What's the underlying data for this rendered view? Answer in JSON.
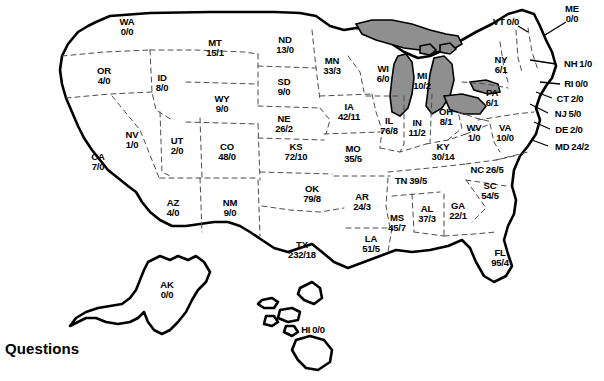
{
  "page": {
    "heading": "Questions",
    "colors": {
      "lake_fill": "#8f8f8f",
      "outline": "#000000",
      "state_border": "#4d4d4d",
      "background": "#ffffff"
    }
  },
  "map": {
    "title": "United States map with per-state value pairs",
    "value_format": "a/b",
    "states": [
      {
        "code": "WA",
        "value": "0/0",
        "x": 127,
        "y": 27,
        "layout": "stacked"
      },
      {
        "code": "OR",
        "value": "4/0",
        "x": 104,
        "y": 76,
        "layout": "stacked"
      },
      {
        "code": "ID",
        "value": "8/0",
        "x": 162,
        "y": 83,
        "layout": "stacked"
      },
      {
        "code": "MT",
        "value": "15/1",
        "x": 215,
        "y": 48,
        "layout": "stacked"
      },
      {
        "code": "WY",
        "value": "9/0",
        "x": 222,
        "y": 104,
        "layout": "stacked"
      },
      {
        "code": "ND",
        "value": "13/0",
        "x": 285,
        "y": 45,
        "layout": "stacked"
      },
      {
        "code": "SD",
        "value": "9/0",
        "x": 284,
        "y": 87,
        "layout": "stacked"
      },
      {
        "code": "NE",
        "value": "26/2",
        "x": 284,
        "y": 124,
        "layout": "stacked"
      },
      {
        "code": "NV",
        "value": "1/0",
        "x": 132,
        "y": 140,
        "layout": "stacked"
      },
      {
        "code": "UT",
        "value": "2/0",
        "x": 177,
        "y": 146,
        "layout": "stacked"
      },
      {
        "code": "CO",
        "value": "48/0",
        "x": 227,
        "y": 152,
        "layout": "stacked"
      },
      {
        "code": "CA",
        "value": "7/0",
        "x": 98,
        "y": 162,
        "layout": "stacked"
      },
      {
        "code": "AZ",
        "value": "4/0",
        "x": 173,
        "y": 208,
        "layout": "stacked"
      },
      {
        "code": "NM",
        "value": "9/0",
        "x": 230,
        "y": 208,
        "layout": "stacked"
      },
      {
        "code": "KS",
        "value": "72/10",
        "x": 296,
        "y": 152,
        "layout": "stacked"
      },
      {
        "code": "OK",
        "value": "79/8",
        "x": 312,
        "y": 194,
        "layout": "stacked"
      },
      {
        "code": "TX",
        "value": "232/18",
        "x": 302,
        "y": 250,
        "layout": "stacked"
      },
      {
        "code": "MN",
        "value": "33/3",
        "x": 332,
        "y": 66,
        "layout": "stacked"
      },
      {
        "code": "IA",
        "value": "42/11",
        "x": 349,
        "y": 112,
        "layout": "stacked"
      },
      {
        "code": "MO",
        "value": "35/5",
        "x": 353,
        "y": 154,
        "layout": "stacked"
      },
      {
        "code": "AR",
        "value": "24/3",
        "x": 362,
        "y": 202,
        "layout": "stacked"
      },
      {
        "code": "LA",
        "value": "51/5",
        "x": 371,
        "y": 244,
        "layout": "stacked"
      },
      {
        "code": "WI",
        "value": "6/0",
        "x": 383,
        "y": 74,
        "layout": "stacked"
      },
      {
        "code": "IL",
        "value": "76/8",
        "x": 389,
        "y": 126,
        "layout": "stacked"
      },
      {
        "code": "MS",
        "value": "45/7",
        "x": 397,
        "y": 223,
        "layout": "stacked"
      },
      {
        "code": "MI",
        "value": "10/2",
        "x": 422,
        "y": 81,
        "layout": "stacked"
      },
      {
        "code": "IN",
        "value": "11/2",
        "x": 417,
        "y": 128,
        "layout": "stacked"
      },
      {
        "code": "AL",
        "value": "37/3",
        "x": 427,
        "y": 214,
        "layout": "stacked"
      },
      {
        "code": "OH",
        "value": "8/1",
        "x": 446,
        "y": 117,
        "layout": "stacked"
      },
      {
        "code": "KY",
        "value": "30/14",
        "x": 443,
        "y": 152,
        "layout": "stacked"
      },
      {
        "code": "GA",
        "value": "22/1",
        "x": 458,
        "y": 211,
        "layout": "stacked"
      },
      {
        "code": "WV",
        "value": "1/0",
        "x": 474,
        "y": 133,
        "layout": "stacked"
      },
      {
        "code": "VA",
        "value": "10/0",
        "x": 505,
        "y": 133,
        "layout": "stacked"
      },
      {
        "code": "PA",
        "value": "6/1",
        "x": 492,
        "y": 98,
        "layout": "stacked"
      },
      {
        "code": "NY",
        "value": "6/1",
        "x": 501,
        "y": 65,
        "layout": "stacked"
      },
      {
        "code": "SC",
        "value": "54/5",
        "x": 490,
        "y": 191,
        "layout": "stacked"
      },
      {
        "code": "FL",
        "value": "95/4",
        "x": 500,
        "y": 258,
        "layout": "stacked"
      },
      {
        "code": "TN",
        "value": "39/5",
        "x": 411,
        "y": 181,
        "layout": "inline"
      },
      {
        "code": "NC",
        "value": "26/5",
        "x": 487,
        "y": 170,
        "layout": "inline"
      },
      {
        "code": "VT",
        "value": "0/0",
        "x": 506,
        "y": 22,
        "layout": "inline"
      },
      {
        "code": "ME",
        "value": "0/0",
        "x": 572,
        "y": 14,
        "layout": "stacked"
      },
      {
        "code": "NH",
        "value": "1/0",
        "x": 578,
        "y": 64,
        "layout": "inline"
      },
      {
        "code": "RI",
        "value": "0/0",
        "x": 576,
        "y": 84,
        "layout": "inline"
      },
      {
        "code": "CT",
        "value": "2/0",
        "x": 570,
        "y": 99,
        "layout": "inline"
      },
      {
        "code": "NJ",
        "value": "5/0",
        "x": 568,
        "y": 114,
        "layout": "inline"
      },
      {
        "code": "DE",
        "value": "2/0",
        "x": 569,
        "y": 130,
        "layout": "inline"
      },
      {
        "code": "MD",
        "value": "24/2",
        "x": 572,
        "y": 147,
        "layout": "inline"
      },
      {
        "code": "AK",
        "value": "0/0",
        "x": 167,
        "y": 290,
        "layout": "stacked"
      },
      {
        "code": "HI",
        "value": "0/0",
        "x": 313,
        "y": 330,
        "layout": "inline"
      }
    ]
  }
}
